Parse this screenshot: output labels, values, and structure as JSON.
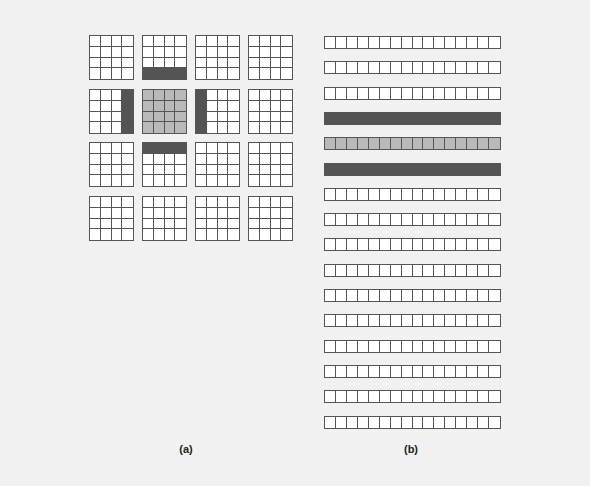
{
  "figure": {
    "colors": {
      "white": "#ffffff",
      "light": "#b9b9b9",
      "dark": "#545454",
      "grid_line": "#555555"
    },
    "panel_a": {
      "label": "(a)",
      "grid_rows": 4,
      "grid_cols": 4,
      "cells_per_block": "4x4",
      "highlighted": [
        {
          "block": [
            1,
            1
          ],
          "fill": "light",
          "region": "all"
        },
        {
          "block": [
            0,
            1
          ],
          "fill": "dark",
          "region": "bottom-row"
        },
        {
          "block": [
            2,
            1
          ],
          "fill": "dark",
          "region": "top-row"
        },
        {
          "block": [
            1,
            0
          ],
          "fill": "dark",
          "region": "right-column"
        },
        {
          "block": [
            1,
            2
          ],
          "fill": "dark",
          "region": "left-column"
        }
      ]
    },
    "panel_b": {
      "label": "(b)",
      "strip_count": 16,
      "cells_per_strip": 16,
      "fills": [
        "white",
        "white",
        "white",
        "dark",
        "light",
        "dark",
        "white",
        "white",
        "white",
        "white",
        "white",
        "white",
        "white",
        "white",
        "white",
        "white"
      ]
    }
  }
}
